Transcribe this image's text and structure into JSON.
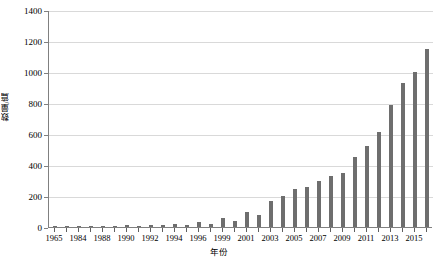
{
  "chart_data": {
    "type": "bar",
    "title": "",
    "xlabel": "年份",
    "ylabel": "数量/篇",
    "ylim": [
      0,
      1400
    ],
    "ytick_interval": 200,
    "ytick_labels": [
      "0",
      "200",
      "400",
      "600",
      "800",
      "1000",
      "1200",
      "1400"
    ],
    "grid": true,
    "legend": "none",
    "bar_color": "#6e6e6e",
    "gridline_color": "#d9d9d9",
    "axis_color": "#808080",
    "xtick_labels_shown": [
      "1965",
      "1984",
      "1988",
      "1990",
      "1992",
      "1994",
      "1996",
      "1999",
      "2001",
      "2003",
      "2005",
      "2007",
      "2009",
      "2011",
      "2013",
      "2015"
    ],
    "categories": [
      "1965",
      "1983",
      "1984",
      "1987",
      "1988",
      "1989",
      "1990",
      "1991",
      "1992",
      "1993",
      "1994",
      "1995",
      "1996",
      "1997",
      "1999",
      "2000",
      "2001",
      "2002",
      "2003",
      "2004",
      "2005",
      "2006",
      "2007",
      "2008",
      "2009",
      "2010",
      "2011",
      "2012",
      "2013",
      "2014",
      "2015",
      "2016"
    ],
    "values": [
      4,
      3,
      5,
      4,
      6,
      5,
      10,
      8,
      12,
      10,
      18,
      14,
      30,
      22,
      55,
      40,
      95,
      75,
      170,
      200,
      245,
      260,
      300,
      330,
      350,
      450,
      520,
      610,
      790,
      930,
      1000,
      1150
    ]
  }
}
